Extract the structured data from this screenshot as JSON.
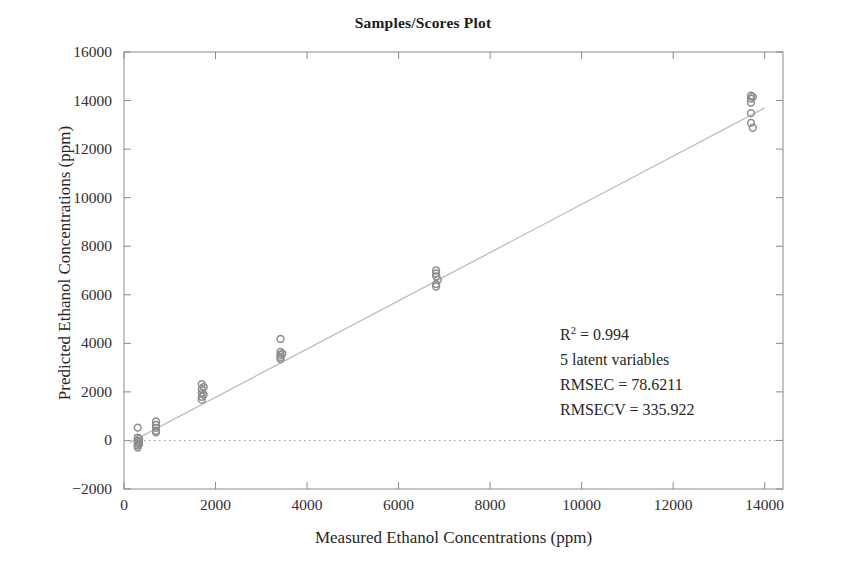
{
  "figure": {
    "title": "Samples/Scores Plot",
    "background": "#ffffff",
    "axis_color": "#8a8a8a",
    "point_color": "#8d8d8d",
    "fit_line_color": "#b9b9b9",
    "zero_line_color": "#9a9a9a"
  },
  "annotation": {
    "r2_prefix": "R",
    "r2_exponent": "2",
    "r2_value": " = 0.994",
    "latent": "5 latent variables",
    "rmsec": "RMSEC = 78.6211",
    "rmsecv": "RMSECV = 335.922"
  },
  "chart_data": {
    "type": "scatter",
    "title": "Samples/Scores Plot",
    "xlabel": "Measured Ethanol Concentrations (ppm)",
    "ylabel": "Predicted Ethanol Concentrations (ppm)",
    "xlim": [
      0,
      14400
    ],
    "ylim": [
      -2000,
      16000
    ],
    "xticks": [
      0,
      2000,
      4000,
      6000,
      8000,
      10000,
      12000,
      14000
    ],
    "yticks": [
      -2000,
      0,
      2000,
      4000,
      6000,
      8000,
      10000,
      12000,
      14000,
      16000
    ],
    "xtick_labels": [
      "0",
      "2000",
      "4000",
      "6000",
      "8000",
      "10000",
      "12000",
      "14000"
    ],
    "ytick_labels": [
      "-2000",
      "0",
      "2000",
      "4000",
      "6000",
      "8000",
      "10000",
      "12000",
      "14000",
      "16000"
    ],
    "grid": false,
    "legend": null,
    "statistics": {
      "r_squared": 0.994,
      "latent_variables": 5,
      "rmsec": 78.6211,
      "rmsecv": 335.922
    },
    "reference_lines": [
      {
        "name": "zero-line",
        "type": "horizontal",
        "y": 0,
        "style": "dotted"
      },
      {
        "name": "fit-line",
        "type": "linear",
        "x0": 120,
        "y0": -90,
        "x1": 14000,
        "y1": 13700,
        "style": "solid"
      }
    ],
    "series": [
      {
        "name": "samples",
        "marker": "circle",
        "color": "#8d8d8d",
        "points": [
          {
            "x": 300,
            "y": 530
          },
          {
            "x": 300,
            "y": 120
          },
          {
            "x": 300,
            "y": -20
          },
          {
            "x": 300,
            "y": -110
          },
          {
            "x": 300,
            "y": -210
          },
          {
            "x": 300,
            "y": -290
          },
          {
            "x": 330,
            "y": 60
          },
          {
            "x": 330,
            "y": -60
          },
          {
            "x": 330,
            "y": -160
          },
          {
            "x": 700,
            "y": 780
          },
          {
            "x": 700,
            "y": 640
          },
          {
            "x": 700,
            "y": 520
          },
          {
            "x": 700,
            "y": 400
          },
          {
            "x": 700,
            "y": 330
          },
          {
            "x": 1700,
            "y": 2320
          },
          {
            "x": 1700,
            "y": 2120
          },
          {
            "x": 1700,
            "y": 1960
          },
          {
            "x": 1700,
            "y": 1800
          },
          {
            "x": 1700,
            "y": 1680
          },
          {
            "x": 1740,
            "y": 2200
          },
          {
            "x": 1740,
            "y": 1880
          },
          {
            "x": 3420,
            "y": 4180
          },
          {
            "x": 3420,
            "y": 3650
          },
          {
            "x": 3420,
            "y": 3520
          },
          {
            "x": 3420,
            "y": 3430
          },
          {
            "x": 3420,
            "y": 3350
          },
          {
            "x": 3460,
            "y": 3580
          },
          {
            "x": 6820,
            "y": 7000
          },
          {
            "x": 6820,
            "y": 6880
          },
          {
            "x": 6820,
            "y": 6760
          },
          {
            "x": 6820,
            "y": 6440
          },
          {
            "x": 6820,
            "y": 6340
          },
          {
            "x": 6860,
            "y": 6620
          },
          {
            "x": 13700,
            "y": 14200
          },
          {
            "x": 13700,
            "y": 14080
          },
          {
            "x": 13700,
            "y": 13920
          },
          {
            "x": 13700,
            "y": 13480
          },
          {
            "x": 13700,
            "y": 13080
          },
          {
            "x": 13740,
            "y": 14150
          },
          {
            "x": 13740,
            "y": 12880
          }
        ]
      }
    ]
  }
}
